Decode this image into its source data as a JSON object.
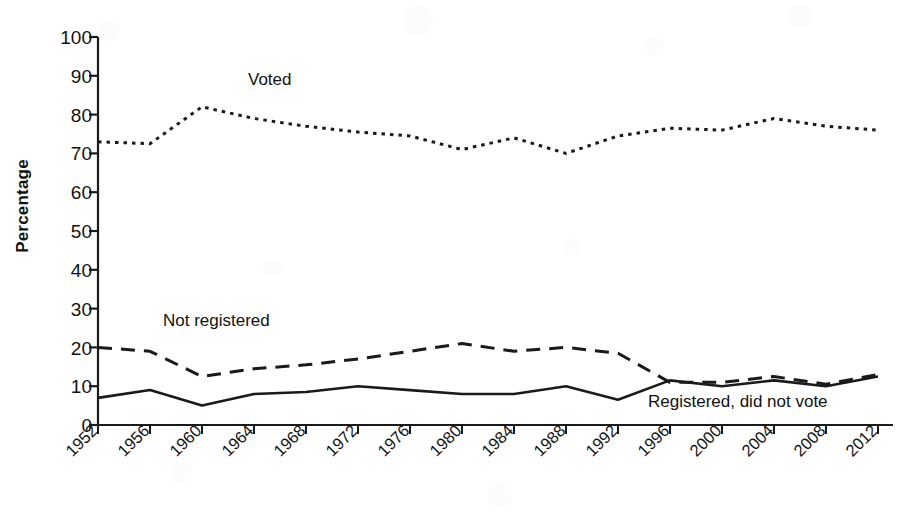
{
  "chart_data": {
    "type": "line",
    "title": "",
    "xlabel": "",
    "ylabel": "Percentage",
    "categories": [
      "1952",
      "1956",
      "1960",
      "1964",
      "1968",
      "1972",
      "1976",
      "1980",
      "1984",
      "1988",
      "1992",
      "1996",
      "2000",
      "2004",
      "2008",
      "2012"
    ],
    "ylim": [
      0,
      100
    ],
    "ytick_step": 10,
    "yticks": [
      "0",
      "10",
      "20",
      "30",
      "40",
      "50",
      "60",
      "70",
      "80",
      "90",
      "100"
    ],
    "grid": false,
    "legend_position": "inline-annotations",
    "series": [
      {
        "name": "Voted",
        "style": "dotted",
        "color": "#1a1a1a",
        "annotation": "Voted",
        "values": [
          73,
          72.5,
          82,
          79,
          77,
          75.5,
          74.5,
          71,
          74,
          70,
          74.5,
          76.5,
          76,
          79,
          77,
          76
        ]
      },
      {
        "name": "Not registered",
        "style": "dashed",
        "color": "#1a1a1a",
        "annotation": "Not registered",
        "values": [
          20,
          19,
          12.5,
          14.5,
          15.5,
          17,
          19,
          21,
          19,
          20,
          18.5,
          11,
          11,
          12.5,
          10.5,
          13
        ]
      },
      {
        "name": "Registered, did not vote",
        "style": "solid",
        "color": "#1a1a1a",
        "annotation": "Registered, did not vote",
        "values": [
          7,
          9,
          5,
          8,
          8.5,
          10,
          9,
          8,
          8,
          10,
          6.5,
          11.5,
          10,
          11.5,
          10,
          12.5
        ]
      }
    ],
    "annotations": [
      {
        "text": "Voted",
        "x": 1960,
        "y": 91
      },
      {
        "text": "Not registered",
        "x": 1957,
        "y": 27
      },
      {
        "text": "Registered, did not vote",
        "x": 2002,
        "y": 5
      }
    ]
  },
  "axis": {
    "ylabel": "Percentage",
    "ytick_labels": [
      "100",
      "90",
      "80",
      "70",
      "60",
      "50",
      "40",
      "30",
      "20",
      "10",
      "0"
    ],
    "xtick_labels": [
      "1952",
      "1956",
      "1960",
      "1964",
      "1968",
      "1972",
      "1976",
      "1980",
      "1984",
      "1988",
      "1992",
      "1996",
      "2000",
      "2004",
      "2008",
      "2012"
    ]
  },
  "colors": {
    "ink": "#1a1a1a",
    "paper": "#ffffff"
  }
}
